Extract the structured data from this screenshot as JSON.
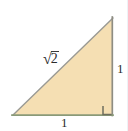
{
  "figure": {
    "kind": "right-triangle-diagram",
    "background_color": "#ffffff",
    "fill_color": "#f5dfb3",
    "hypotenuse_stroke": "#9a9a94",
    "vertical_leg_stroke": "#8e8d83",
    "horizontal_leg_stroke": "#8a9a78",
    "right_angle_stroke": "#6f6f5f",
    "label_color": "#2b2b2b",
    "vertices": {
      "apex": [
        113,
        18
      ],
      "bottom_left": [
        13,
        115
      ],
      "bottom_right": [
        112,
        115
      ]
    },
    "right_angle_marker": {
      "x": 103,
      "y": 106,
      "size": 9,
      "at_vertex": "bottom_right"
    }
  },
  "labels": {
    "hypotenuse": {
      "radical": "√",
      "radicand": "2",
      "full_text": "√2"
    },
    "right_leg": "1",
    "bottom_leg": "1"
  }
}
